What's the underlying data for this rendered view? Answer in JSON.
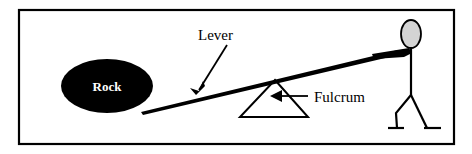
{
  "figure": {
    "type": "diagram",
    "background_color": "#ffffff",
    "border": {
      "name": "outer-frame",
      "color": "#000000",
      "stroke_width": 2,
      "x": 19,
      "y": 10,
      "width": 435,
      "height": 134
    }
  },
  "labels": {
    "lever": "Lever",
    "fulcrum": "Fulcrum",
    "rock": "Rock"
  },
  "shapes": {
    "rock": {
      "name": "rock-ellipse",
      "fill": "#000000",
      "cx": 107,
      "cy": 86,
      "rx": 46,
      "ry": 27
    },
    "lever": {
      "name": "lever-beam",
      "color": "#000000",
      "x1": 142,
      "y1": 110,
      "x2": 398,
      "y2": 52
    },
    "fulcrum_triangle": {
      "name": "fulcrum-triangle",
      "color": "#000000",
      "stroke_width": 2,
      "apex_x": 275,
      "apex_y": 80,
      "base_left_x": 240,
      "base_right_x": 308,
      "base_y": 117
    },
    "person": {
      "name": "stick-figure-person",
      "head_fill": "#d4d4d4",
      "head_stroke": "#000000",
      "head_cx": 411,
      "head_cy": 34,
      "head_rx": 10,
      "head_ry": 14,
      "body_x": 411,
      "body_top_y": 48,
      "body_bottom_y": 94,
      "arm_tip_x": 372,
      "arm_tip_y": 56
    }
  },
  "annotations": {
    "lever_pointer": {
      "name": "lever-arrow",
      "from_x": 226,
      "from_y": 46,
      "to_x": 198,
      "to_y": 91
    },
    "fulcrum_pointer": {
      "name": "fulcrum-arrow",
      "from_x": 306,
      "from_y": 96,
      "to_x": 272,
      "to_y": 96
    }
  },
  "colors": {
    "ink": "#000000",
    "paper": "#ffffff",
    "head_gray": "#d4d4d4"
  }
}
